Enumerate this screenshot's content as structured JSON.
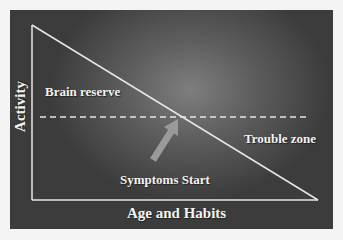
{
  "diagram": {
    "labels": {
      "brain_reserve": "Brain reserve",
      "trouble_zone": "Trouble zone",
      "symptoms_start": "Symptoms Start",
      "x_axis": "Age and Habits",
      "y_axis": "Activity"
    },
    "colors": {
      "background": "#4a4a4a",
      "lines": "#e6e6e6",
      "arrow": "#9a9a9a",
      "text": "#f2f2f2"
    }
  }
}
